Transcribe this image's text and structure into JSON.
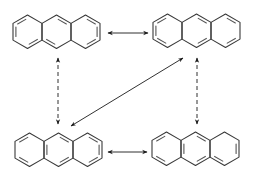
{
  "diagram": {
    "stroke_color": "#3a3a3a",
    "bond_color": "#555555",
    "molecules": [
      {
        "id": "top-left",
        "label": "Anthracene resonance structure 1",
        "x": 13,
        "y": 14,
        "doubles": [
          [
            "r0",
            "left"
          ],
          [
            "r0",
            "ul"
          ],
          [
            "r0",
            "lr"
          ],
          [
            "r1",
            "ur"
          ],
          [
            "r1",
            "ll"
          ],
          [
            "r2",
            "ur"
          ],
          [
            "r2",
            "right"
          ],
          [
            "r2",
            "lr"
          ]
        ]
      },
      {
        "id": "top-right",
        "label": "Anthracene resonance structure 2",
        "x": 153,
        "y": 13,
        "doubles": [
          [
            "r0",
            "ul"
          ],
          [
            "r0",
            "left"
          ],
          [
            "r0",
            "ll"
          ],
          [
            "r1",
            "ur"
          ],
          [
            "r1",
            "lr"
          ],
          [
            "r2",
            "ur"
          ],
          [
            "r2",
            "lr"
          ]
        ]
      },
      {
        "id": "bottom-left",
        "label": "Anthracene resonance structure 3",
        "x": 15,
        "y": 132,
        "doubles": [
          [
            "r0",
            "ul"
          ],
          [
            "r0",
            "ll"
          ],
          [
            "r1",
            "ur"
          ],
          [
            "r1",
            "lr"
          ],
          [
            "r1",
            "leftshared"
          ],
          [
            "r2",
            "ur"
          ],
          [
            "r2",
            "right"
          ],
          [
            "r2",
            "lr"
          ]
        ]
      },
      {
        "id": "bottom-right",
        "label": "Anthracene resonance structure 4",
        "x": 152,
        "y": 131,
        "doubles": [
          [
            "r0",
            "ul"
          ],
          [
            "r0",
            "ll"
          ],
          [
            "r1",
            "ur"
          ],
          [
            "r1",
            "lr"
          ],
          [
            "r1",
            "leftshared"
          ],
          [
            "r2",
            "right"
          ],
          [
            "r2",
            "ll"
          ]
        ]
      }
    ],
    "arrows": [
      {
        "id": "top-horizontal",
        "type": "double-headed",
        "style": "solid",
        "from": [
          108,
          33
        ],
        "to": [
          148,
          33
        ]
      },
      {
        "id": "bottom-horizontal",
        "type": "double-headed",
        "style": "solid",
        "from": [
          108,
          152
        ],
        "to": [
          147,
          152
        ]
      },
      {
        "id": "left-vertical",
        "type": "double-headed",
        "style": "dashed",
        "from": [
          58,
          58
        ],
        "to": [
          58,
          124
        ]
      },
      {
        "id": "right-vertical",
        "type": "double-headed",
        "style": "dashed",
        "from": [
          197,
          58
        ],
        "to": [
          197,
          124
        ]
      },
      {
        "id": "diagonal",
        "type": "double-headed",
        "style": "solid",
        "from": [
          183,
          58
        ],
        "to": [
          71,
          126
        ]
      }
    ]
  }
}
